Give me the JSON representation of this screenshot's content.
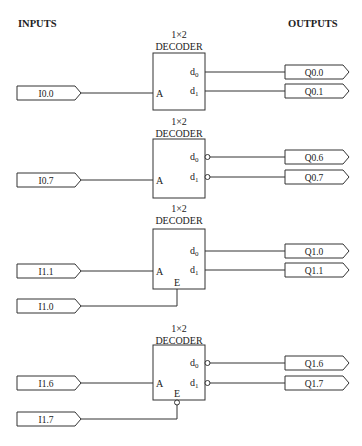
{
  "headers": {
    "inputs": "INPUTS",
    "outputs": "OUTPUTS"
  },
  "blocks": [
    {
      "title_top": "1×2",
      "title_bottom": "DECODER",
      "pin_a": "A",
      "pin_e": "",
      "d0": "d",
      "d1": "d",
      "sub0": "0",
      "sub1": "1",
      "inverted_outputs": false,
      "enable": "none",
      "input_a": "I0.0",
      "input_e": "",
      "out0": "Q0.0",
      "out1": "Q0.1"
    },
    {
      "title_top": "1×2",
      "title_bottom": "DECODER",
      "pin_a": "A",
      "pin_e": "",
      "d0": "d",
      "d1": "d",
      "sub0": "0",
      "sub1": "1",
      "inverted_outputs": true,
      "enable": "none",
      "input_a": "I0.7",
      "input_e": "",
      "out0": "Q0.6",
      "out1": "Q0.7"
    },
    {
      "title_top": "1×2",
      "title_bottom": "DECODER",
      "pin_a": "A",
      "pin_e": "E",
      "d0": "d",
      "d1": "d",
      "sub0": "0",
      "sub1": "1",
      "inverted_outputs": false,
      "enable": "active-high",
      "input_a": "I1.1",
      "input_e": "I1.0",
      "out0": "Q1.0",
      "out1": "Q1.1"
    },
    {
      "title_top": "1×2",
      "title_bottom": "DECODER",
      "pin_a": "A",
      "pin_e": "E",
      "d0": "d",
      "d1": "d",
      "sub0": "0",
      "sub1": "1",
      "inverted_outputs": true,
      "enable": "active-low",
      "input_a": "I1.6",
      "input_e": "I1.7",
      "out0": "Q1.6",
      "out1": "Q1.7"
    }
  ]
}
